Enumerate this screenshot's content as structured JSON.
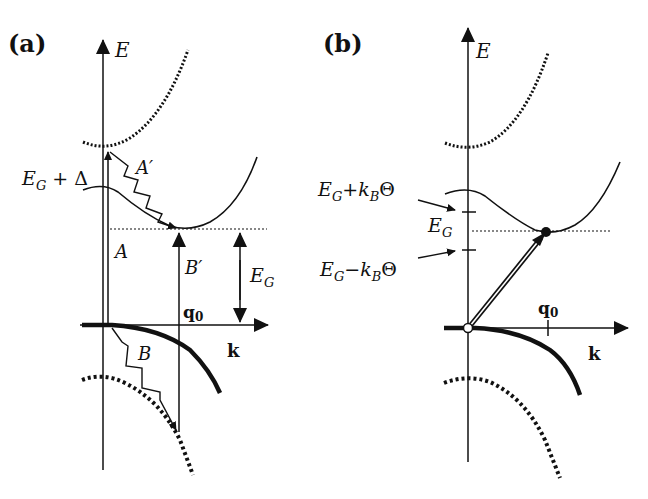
{
  "panel_a": {
    "label": "(a)",
    "axis_y": "E",
    "axis_x": "k",
    "labels": {
      "eg_delta": "E",
      "eg_delta_sub": "G",
      "eg_delta_rest": " + Δ",
      "A": "A",
      "A_prime": "A′",
      "B": "B",
      "B_prime": "B′",
      "EG": "E",
      "EG_sub": "G",
      "q0": "q",
      "q0_sub": "0"
    }
  },
  "panel_b": {
    "label": "(b)",
    "axis_y": "E",
    "axis_x": "k",
    "labels": {
      "plus_main": "E",
      "plus_sub": "G",
      "plus_rest": "+k",
      "plus_sub2": "B",
      "plus_theta": "Θ",
      "EG": "E",
      "EG_sub": "G",
      "minus_main": "E",
      "minus_sub": "G",
      "minus_rest": "−k",
      "minus_sub2": "B",
      "minus_theta": "Θ",
      "q0": "q",
      "q0_sub": "0"
    }
  },
  "colors": {
    "ink": "#111111",
    "background": "#ffffff"
  }
}
